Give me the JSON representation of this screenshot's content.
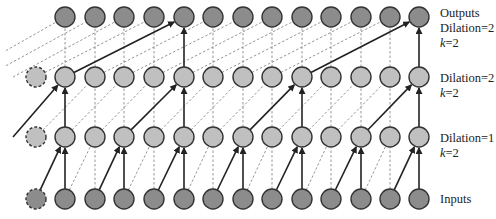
{
  "diagram": {
    "columns_x": [
      36,
      65,
      95,
      124,
      154,
      184,
      213,
      243,
      272,
      302,
      331,
      361,
      390,
      419
    ],
    "padding_columns": [
      0
    ],
    "layers": [
      {
        "id": "inputs",
        "y": 199,
        "fill": "#8c8c8c",
        "label_lines": [
          "Inputs"
        ]
      },
      {
        "id": "hidden1",
        "y": 137,
        "fill": "#c0c0c0",
        "label_lines": [
          "Dilation=1",
          "k=2"
        ]
      },
      {
        "id": "hidden2",
        "y": 77,
        "fill": "#c0c0c0",
        "label_lines": [
          "Dilation=2",
          "k=2"
        ]
      },
      {
        "id": "outputs",
        "y": 17,
        "fill": "#8c8c8c",
        "label_lines": [
          "Outputs",
          "Dilation=2",
          "k=2"
        ]
      }
    ],
    "connections": [
      {
        "from_layer": 0,
        "to_layer": 1,
        "span": 1,
        "solid_targets": [
          1,
          3,
          5,
          7,
          9,
          11,
          13
        ]
      },
      {
        "from_layer": 1,
        "to_layer": 2,
        "span": 2,
        "solid_targets": [
          1,
          5,
          9,
          13
        ]
      },
      {
        "from_layer": 2,
        "to_layer": 3,
        "span": 4,
        "solid_targets": [
          5,
          13
        ]
      }
    ],
    "node_radius": 10,
    "colors": {
      "stroke": "#333333",
      "solid_edge": "#222222",
      "dashed_edge": "#8a8a8a"
    }
  },
  "labels": {
    "outputs": {
      "line1": "Outputs",
      "line2": "Dilation=2",
      "line3_k": "k",
      "line3_rest": "=2"
    },
    "hidden2": {
      "line1": "Dilation=2",
      "line2_k": "k",
      "line2_rest": "=2"
    },
    "hidden1": {
      "line1": "Dilation=1",
      "line2_k": "k",
      "line2_rest": "=2"
    },
    "inputs": {
      "line1": "Inputs"
    }
  }
}
